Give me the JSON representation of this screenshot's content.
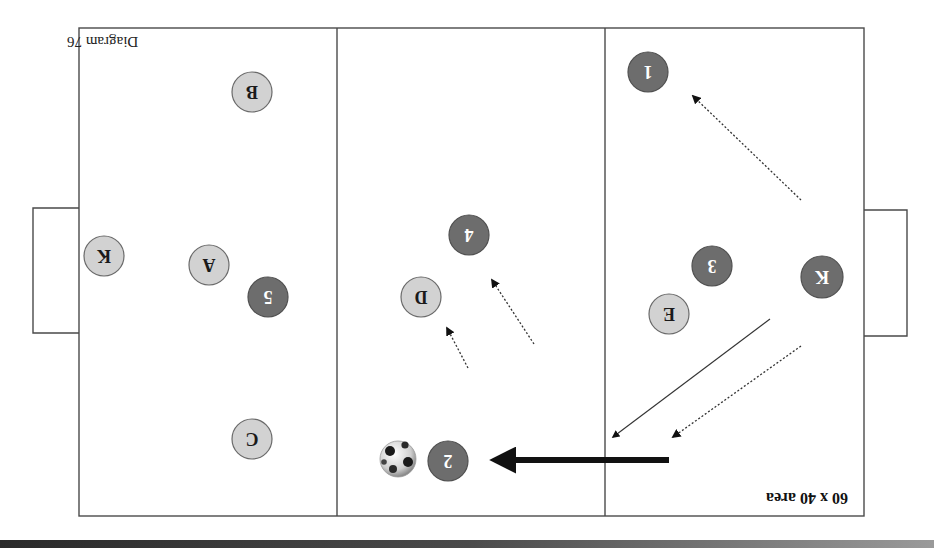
{
  "diagram": {
    "title": "60 x 40 area",
    "caption": "Diagram 76",
    "orientation": "rotated 180 degrees",
    "colors": {
      "attacker": "#6d6d6d",
      "defender": "#d2d2d2",
      "line": "#4a4a4a"
    },
    "players": {
      "attackers": [
        {
          "label": "1"
        },
        {
          "label": "3"
        },
        {
          "label": "K"
        },
        {
          "label": "4"
        },
        {
          "label": "5"
        },
        {
          "label": "2"
        }
      ],
      "defenders": [
        {
          "label": "B"
        },
        {
          "label": "A"
        },
        {
          "label": "K"
        },
        {
          "label": "D"
        },
        {
          "label": "E"
        },
        {
          "label": "C"
        }
      ]
    },
    "ball": {
      "name": "soccer-ball"
    },
    "zones": [
      "left-third",
      "middle-third",
      "right-third"
    ]
  }
}
